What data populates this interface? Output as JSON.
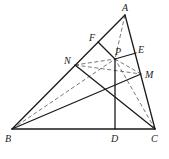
{
  "diagram": {
    "points": {
      "A": {
        "label": "A"
      },
      "B": {
        "label": "B"
      },
      "C": {
        "label": "C"
      },
      "D": {
        "label": "D"
      },
      "E": {
        "label": "E"
      },
      "F": {
        "label": "F"
      },
      "M": {
        "label": "M"
      },
      "N": {
        "label": "N"
      },
      "P": {
        "label": "P"
      }
    },
    "solid_segments": [
      "AB",
      "AC",
      "BC",
      "PF",
      "PE",
      "PD",
      "BM",
      "NC"
    ],
    "dashed_segments": [
      "AP",
      "BP",
      "CP",
      "NP",
      "NM",
      "PM"
    ],
    "caption": ""
  }
}
